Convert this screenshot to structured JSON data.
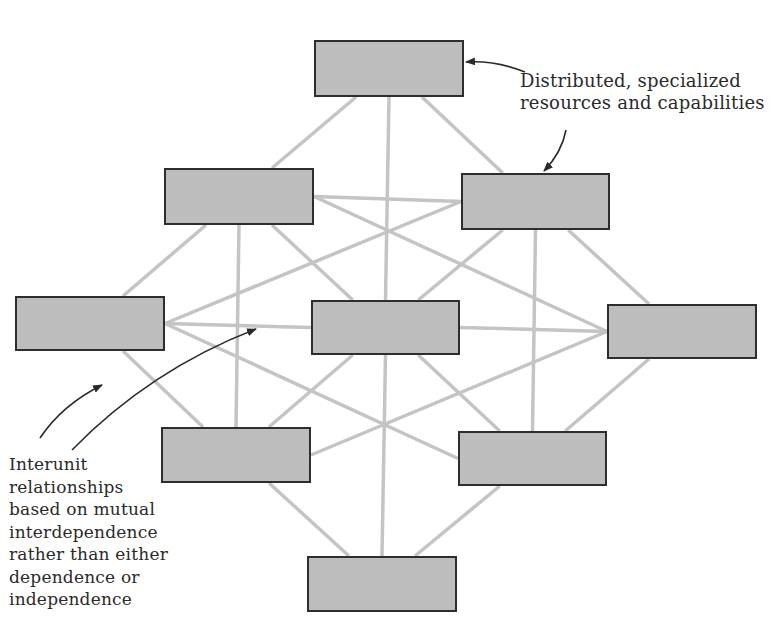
{
  "diagram": {
    "type": "network-organization",
    "node_fill": "#bdbdbd",
    "node_border": "#2e2e2e",
    "link_color": "#c4c4c4",
    "arrow_color": "#2a2a2a",
    "nodes": [
      {
        "id": "top",
        "x": 314,
        "y": 40,
        "w": 150,
        "h": 57
      },
      {
        "id": "upper-left",
        "x": 164,
        "y": 168,
        "w": 150,
        "h": 57
      },
      {
        "id": "upper-right",
        "x": 461,
        "y": 173,
        "w": 149,
        "h": 57
      },
      {
        "id": "left",
        "x": 15,
        "y": 296,
        "w": 150,
        "h": 55
      },
      {
        "id": "center",
        "x": 311,
        "y": 300,
        "w": 149,
        "h": 55
      },
      {
        "id": "right",
        "x": 607,
        "y": 304,
        "w": 150,
        "h": 55
      },
      {
        "id": "lower-left",
        "x": 161,
        "y": 427,
        "w": 150,
        "h": 56
      },
      {
        "id": "lower-right",
        "x": 458,
        "y": 431,
        "w": 149,
        "h": 55
      },
      {
        "id": "bottom",
        "x": 307,
        "y": 556,
        "w": 150,
        "h": 56
      }
    ],
    "links": [
      [
        "top",
        "upper-left"
      ],
      [
        "top",
        "upper-right"
      ],
      [
        "top",
        "center"
      ],
      [
        "upper-left",
        "upper-right"
      ],
      [
        "upper-left",
        "left"
      ],
      [
        "upper-left",
        "center"
      ],
      [
        "upper-left",
        "right"
      ],
      [
        "upper-left",
        "lower-left"
      ],
      [
        "upper-right",
        "right"
      ],
      [
        "upper-right",
        "center"
      ],
      [
        "upper-right",
        "left"
      ],
      [
        "upper-right",
        "lower-right"
      ],
      [
        "left",
        "center"
      ],
      [
        "left",
        "lower-left"
      ],
      [
        "left",
        "lower-right"
      ],
      [
        "center",
        "right"
      ],
      [
        "center",
        "lower-left"
      ],
      [
        "center",
        "lower-right"
      ],
      [
        "center",
        "bottom"
      ],
      [
        "right",
        "lower-right"
      ],
      [
        "right",
        "lower-left"
      ],
      [
        "lower-left",
        "bottom"
      ],
      [
        "lower-right",
        "bottom"
      ]
    ]
  },
  "annotations": {
    "resources": {
      "lines": [
        "Distributed, specialized",
        "resources and capabilities"
      ]
    },
    "relationships": {
      "lines": [
        "Interunit",
        "relationships",
        "based on mutual",
        "interdependence",
        "rather than either",
        "dependence or",
        "independence"
      ]
    }
  }
}
